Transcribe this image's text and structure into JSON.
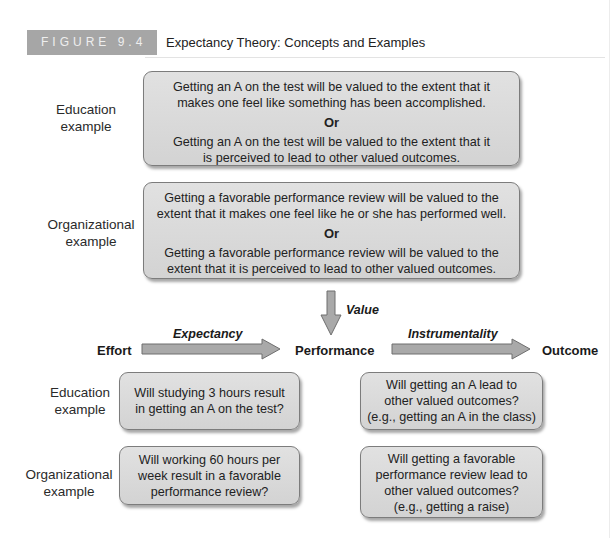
{
  "figure": {
    "badge": "FIGURE 9.4",
    "title": "Expectancy Theory: Concepts and Examples"
  },
  "value_section": {
    "education": {
      "label_line1": "Education",
      "label_line2": "example",
      "box": {
        "line1": "Getting an A on the test will be valued to the extent that it",
        "line2": "makes one feel like something has been accomplished.",
        "or": "Or",
        "line3": "Getting an A on the test will be valued to the extent that it",
        "line4": "is perceived to lead to other valued outcomes."
      }
    },
    "organizational": {
      "label_line1": "Organizational",
      "label_line2": "example",
      "box": {
        "line1": "Getting a favorable performance review will be valued to the",
        "line2": "extent that it makes one feel like he or she has performed well.",
        "or": "Or",
        "line3": "Getting a favorable performance review will be valued to the",
        "line4": "extent that it is perceived to lead to other valued outcomes."
      }
    }
  },
  "flow": {
    "value_label": "Value",
    "effort": "Effort",
    "expectancy_label": "Expectancy",
    "performance": "Performance",
    "instrumentality_label": "Instrumentality",
    "outcome": "Outcome",
    "arrow_color": "#a9a9a9"
  },
  "examples": {
    "education": {
      "label_line1": "Education",
      "label_line2": "example",
      "expectancy_box": [
        "Will studying 3 hours result",
        "in getting an A on the test?"
      ],
      "instrumentality_box": [
        "Will getting an A lead to",
        "other valued outcomes?",
        "(e.g., getting an A in the class)"
      ]
    },
    "organizational": {
      "label_line1": "Organizational",
      "label_line2": "example",
      "expectancy_box": [
        "Will working 60 hours per",
        "week result in a favorable",
        "performance review?"
      ],
      "instrumentality_box": [
        "Will getting a favorable",
        "performance review lead to",
        "other valued outcomes?",
        "(e.g., getting a raise)"
      ]
    }
  }
}
